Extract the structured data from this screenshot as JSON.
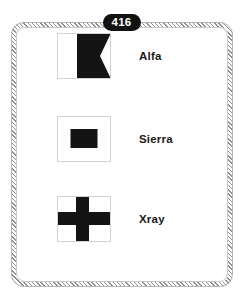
{
  "card": {
    "badge_number": "416",
    "border_color": "#8e8e8e",
    "badge_bg_color": "#111111",
    "badge_text_color": "#ffffff"
  },
  "flags": [
    {
      "name": "Alfa",
      "icon": "maritime-signal-flag-alfa",
      "description": "White hoist half, black fly half with swallowtail notch",
      "shape": "swallowtail-bicolor",
      "colors": [
        "#ffffff",
        "#111111"
      ]
    },
    {
      "name": "Sierra",
      "icon": "maritime-signal-flag-sierra",
      "description": "White field with black rectangle at centre",
      "shape": "center-rectangle",
      "colors": [
        "#ffffff",
        "#111111"
      ]
    },
    {
      "name": "Xray",
      "icon": "maritime-signal-flag-xray",
      "description": "White field with black upright cross",
      "shape": "cross",
      "colors": [
        "#ffffff",
        "#111111"
      ]
    }
  ]
}
